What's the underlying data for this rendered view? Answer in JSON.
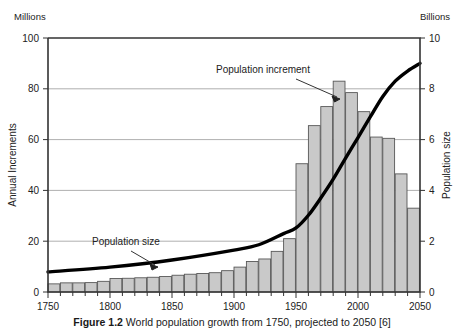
{
  "chart_data": {
    "type": "bar",
    "title": "",
    "subtitle": "",
    "xlabel": "",
    "ylabel": "Annual Increments",
    "y2label": "Population size",
    "left_unit": "Millions",
    "right_unit": "Billions",
    "ylim": [
      0,
      100
    ],
    "y2lim": [
      0,
      10
    ],
    "xlim": [
      1750,
      2050
    ],
    "yticks": [
      0,
      20,
      40,
      60,
      80,
      100
    ],
    "y2ticks": [
      0,
      2,
      4,
      6,
      8,
      10
    ],
    "xticks": [
      1750,
      1800,
      1850,
      1900,
      1950,
      2000,
      2050
    ],
    "xminor_step": 10,
    "grid": "horizontal",
    "legend": "none",
    "bar_color": "#c9c9c9",
    "bar_edge_color": "#585858",
    "line_color": "#000000",
    "categories": [
      1750,
      1760,
      1770,
      1780,
      1790,
      1800,
      1810,
      1820,
      1830,
      1840,
      1850,
      1860,
      1870,
      1880,
      1890,
      1900,
      1910,
      1920,
      1930,
      1940,
      1950,
      1960,
      1970,
      1980,
      1990,
      2000,
      2010,
      2020,
      2030,
      2040
    ],
    "series": [
      {
        "name": "Population increment",
        "axis": "left",
        "unit": "millions per year",
        "type": "bar",
        "values": [
          3.2,
          3.6,
          3.6,
          3.7,
          4.2,
          5.3,
          5.4,
          5.6,
          5.8,
          6.1,
          6.6,
          7.0,
          7.3,
          7.6,
          8.4,
          9.8,
          12.0,
          13.0,
          16.0,
          21.0,
          50.5,
          65.5,
          73.0,
          83.0,
          78.5,
          71.0,
          61.0,
          60.5,
          46.5,
          33.0
        ]
      },
      {
        "name": "Population size",
        "axis": "right",
        "unit": "billions",
        "type": "line",
        "x": [
          1750,
          1800,
          1850,
          1900,
          1920,
          1940,
          1950,
          1960,
          1970,
          1980,
          1990,
          2000,
          2010,
          2020,
          2030,
          2040,
          2050
        ],
        "values": [
          0.79,
          0.98,
          1.26,
          1.65,
          1.86,
          2.3,
          2.52,
          3.02,
          3.7,
          4.44,
          5.27,
          6.08,
          6.9,
          7.7,
          8.3,
          8.7,
          9.0
        ]
      }
    ],
    "annotations": [
      {
        "text": "Population increment",
        "target": "tallest-bars"
      },
      {
        "text": "Population size",
        "target": "population-curve"
      }
    ]
  },
  "caption": {
    "prefix": "Figure 1.2",
    "text": "World population growth from 1750, projected to 2050 [6]"
  }
}
